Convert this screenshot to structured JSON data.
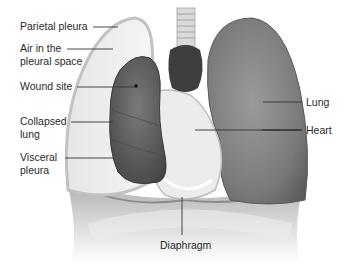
{
  "diagram": {
    "colors": {
      "background": "#ffffff",
      "lung": "#7d7d7d",
      "collapsed_lung": "#5f5f5f",
      "pleura_outline": "#bdbdbd",
      "diaphragm": "#9a9a9a",
      "leader_line": "#333333",
      "label_text": "#2a2a2a"
    },
    "labels": {
      "parietal_pleura": "Parietal pleura",
      "air_pleural_space": "Air in the\npleural space",
      "wound_site": "Wound site",
      "collapsed_lung": "Collapsed\nlung",
      "visceral_pleura": "Visceral\npleura",
      "lung": "Lung",
      "heart": "Heart",
      "diaphragm": "Diaphragm"
    }
  }
}
